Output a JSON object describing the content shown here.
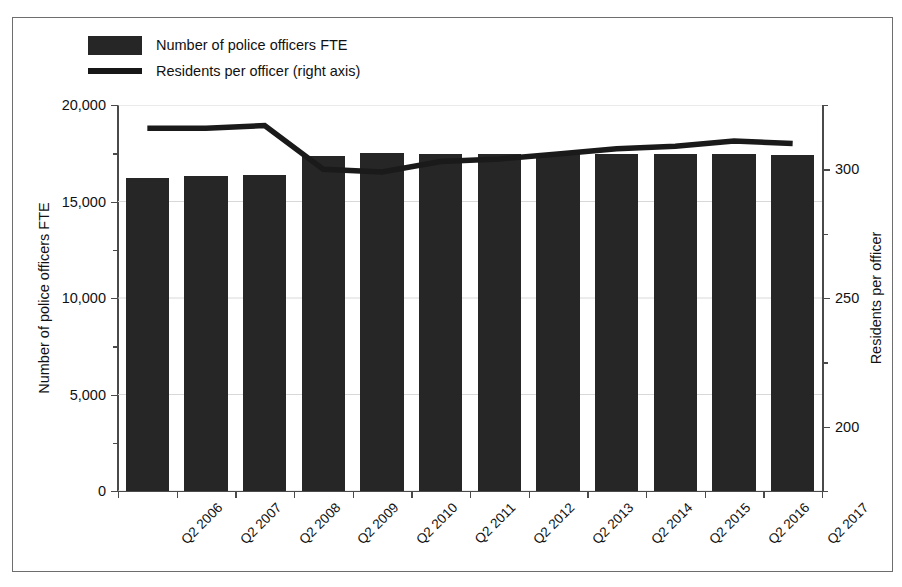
{
  "chart_data": {
    "type": "bar",
    "title": "",
    "categories": [
      "Q2 2006",
      "Q2 2007",
      "Q2 2008",
      "Q2 2009",
      "Q2 2010",
      "Q2 2011",
      "Q2 2012",
      "Q2 2013",
      "Q2 2014",
      "Q2 2015",
      "Q2 2016",
      "Q2 2017"
    ],
    "series": [
      {
        "name": "Number of police officers FTE",
        "chart_type": "bar",
        "axis": "left",
        "color": "#262626",
        "values": [
          16200,
          16300,
          16350,
          17350,
          17500,
          17450,
          17450,
          17450,
          17450,
          17450,
          17450,
          17430
        ]
      },
      {
        "name": "Residents per officer (right axis)",
        "chart_type": "line",
        "axis": "right",
        "color": "#1a1a1a",
        "values": [
          316,
          316,
          317,
          300,
          299,
          303,
          304,
          306,
          308,
          309,
          311,
          310
        ]
      }
    ],
    "xlabel": "",
    "ylabel": "Number of police officers FTE",
    "y2label": "Residents per officer",
    "ylim": [
      0,
      20000
    ],
    "y2lim": [
      175,
      325
    ],
    "yticks": [
      "0",
      "5,000",
      "10,000",
      "15,000",
      "20,000"
    ],
    "ytick_values": [
      0,
      5000,
      10000,
      15000,
      20000
    ],
    "y2ticks": [
      "200",
      "250",
      "300"
    ],
    "y2tick_values": [
      200,
      250,
      300
    ],
    "grid": true,
    "legend_position": "top-left"
  },
  "legend": {
    "bar_label": "Number of police officers FTE",
    "line_label": "Residents per officer (right axis)"
  },
  "axes": {
    "left_title": "Number of police officers FTE",
    "right_title": "Residents per officer"
  }
}
